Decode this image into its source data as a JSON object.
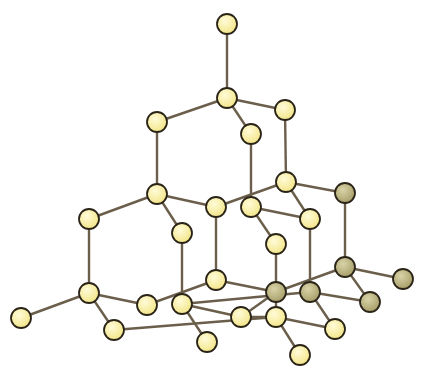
{
  "diagram": {
    "colors": {
      "bond": "#6b5f4c",
      "atom_light_fill": "#f3e68a",
      "atom_light_highlight": "#fffbd8",
      "atom_dark_fill": "#a89f6a",
      "atom_dark_highlight": "#d8d3a8",
      "atom_stroke": "#2a2418"
    },
    "atom_radius": 10,
    "atoms": [
      {
        "id": "a0",
        "x": 227,
        "y": 24,
        "shade": "light"
      },
      {
        "id": "a1",
        "x": 227,
        "y": 98,
        "shade": "light"
      },
      {
        "id": "a2",
        "x": 157,
        "y": 122,
        "shade": "light"
      },
      {
        "id": "a3",
        "x": 285,
        "y": 110,
        "shade": "light"
      },
      {
        "id": "a4",
        "x": 251,
        "y": 134,
        "shade": "light"
      },
      {
        "id": "a5",
        "x": 157,
        "y": 194,
        "shade": "light"
      },
      {
        "id": "a6",
        "x": 286,
        "y": 182,
        "shade": "light"
      },
      {
        "id": "a7",
        "x": 345,
        "y": 193,
        "shade": "dark"
      },
      {
        "id": "a8",
        "x": 89,
        "y": 219,
        "shade": "light"
      },
      {
        "id": "a9",
        "x": 182,
        "y": 233,
        "shade": "light"
      },
      {
        "id": "a10",
        "x": 216,
        "y": 207,
        "shade": "light"
      },
      {
        "id": "a11",
        "x": 251,
        "y": 207,
        "shade": "light"
      },
      {
        "id": "a12",
        "x": 310,
        "y": 219,
        "shade": "light"
      },
      {
        "id": "a13",
        "x": 276,
        "y": 244,
        "shade": "light"
      },
      {
        "id": "a14",
        "x": 216,
        "y": 280,
        "shade": "light"
      },
      {
        "id": "a15",
        "x": 345,
        "y": 267,
        "shade": "dark"
      },
      {
        "id": "a16",
        "x": 403,
        "y": 279,
        "shade": "dark"
      },
      {
        "id": "a17",
        "x": 276,
        "y": 292,
        "shade": "dark"
      },
      {
        "id": "a18",
        "x": 310,
        "y": 292,
        "shade": "dark"
      },
      {
        "id": "a19",
        "x": 370,
        "y": 302,
        "shade": "dark"
      },
      {
        "id": "a20",
        "x": 21,
        "y": 318,
        "shade": "light"
      },
      {
        "id": "a21",
        "x": 89,
        "y": 293,
        "shade": "light"
      },
      {
        "id": "a22",
        "x": 114,
        "y": 330,
        "shade": "light"
      },
      {
        "id": "a23",
        "x": 147,
        "y": 305,
        "shade": "light"
      },
      {
        "id": "a24",
        "x": 182,
        "y": 304,
        "shade": "light"
      },
      {
        "id": "a25",
        "x": 207,
        "y": 342,
        "shade": "light"
      },
      {
        "id": "a26",
        "x": 241,
        "y": 317,
        "shade": "light"
      },
      {
        "id": "a27",
        "x": 276,
        "y": 317,
        "shade": "light"
      },
      {
        "id": "a28",
        "x": 335,
        "y": 329,
        "shade": "light"
      },
      {
        "id": "a29",
        "x": 300,
        "y": 355,
        "shade": "light"
      }
    ],
    "bonds": [
      [
        "a0",
        "a1"
      ],
      [
        "a1",
        "a2"
      ],
      [
        "a1",
        "a3"
      ],
      [
        "a1",
        "a4"
      ],
      [
        "a2",
        "a5"
      ],
      [
        "a3",
        "a6"
      ],
      [
        "a4",
        "a11"
      ],
      [
        "a5",
        "a8"
      ],
      [
        "a5",
        "a9"
      ],
      [
        "a5",
        "a10"
      ],
      [
        "a6",
        "a10"
      ],
      [
        "a6",
        "a7"
      ],
      [
        "a6",
        "a12"
      ],
      [
        "a11",
        "a12"
      ],
      [
        "a11",
        "a13"
      ],
      [
        "a10",
        "a14"
      ],
      [
        "a9",
        "a24"
      ],
      [
        "a8",
        "a21"
      ],
      [
        "a12",
        "a18"
      ],
      [
        "a13",
        "a27"
      ],
      [
        "a7",
        "a15"
      ],
      [
        "a15",
        "a16"
      ],
      [
        "a15",
        "a19"
      ],
      [
        "a15",
        "a17"
      ],
      [
        "a14",
        "a23"
      ],
      [
        "a14",
        "a17"
      ],
      [
        "a18",
        "a19"
      ],
      [
        "a18",
        "a28"
      ],
      [
        "a18",
        "a24"
      ],
      [
        "a21",
        "a20"
      ],
      [
        "a21",
        "a22"
      ],
      [
        "a21",
        "a23"
      ],
      [
        "a24",
        "a25"
      ],
      [
        "a24",
        "a26"
      ],
      [
        "a22",
        "a27"
      ],
      [
        "a27",
        "a26"
      ],
      [
        "a27",
        "a28"
      ],
      [
        "a27",
        "a29"
      ],
      [
        "a17",
        "a26"
      ]
    ]
  }
}
